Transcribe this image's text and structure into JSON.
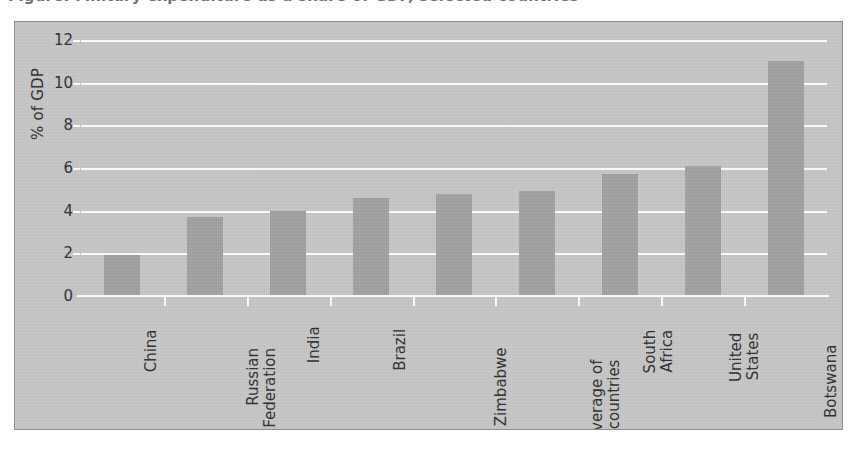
{
  "figure": {
    "title_partial": "Figure: Military expenditure as a share of GDP, selected countries",
    "background_color": "#c6c6c6",
    "bar_color": "#a1a1a1",
    "gridline_color": "#fdfdfd",
    "text_color": "#2e2e2e"
  },
  "chart_data": {
    "type": "bar",
    "title": "",
    "xlabel": "",
    "ylabel": "% of GDP",
    "ylim": [
      0,
      12
    ],
    "yticks": [
      0,
      2,
      4,
      6,
      8,
      10,
      12
    ],
    "ytick_labels": [
      "0",
      "2",
      "4",
      "6",
      "8",
      "10",
      "12"
    ],
    "grid": true,
    "legend": "none",
    "categories": [
      "China",
      "Russian Federation",
      "India",
      "Brazil",
      "Zimbabwe",
      "Average of 154 countries",
      "South Africa",
      "United States",
      "Botswana"
    ],
    "category_lines": [
      [
        "China"
      ],
      [
        "Russian",
        "Federation"
      ],
      [
        "India"
      ],
      [
        "Brazil"
      ],
      [
        "Zimbabwe"
      ],
      [
        "Average of",
        "154 countries"
      ],
      [
        "South",
        "Africa"
      ],
      [
        "United",
        "States"
      ],
      [
        "Botswana"
      ]
    ],
    "values": [
      1.9,
      3.7,
      4.0,
      4.6,
      4.8,
      4.9,
      5.7,
      6.1,
      11.0
    ]
  }
}
